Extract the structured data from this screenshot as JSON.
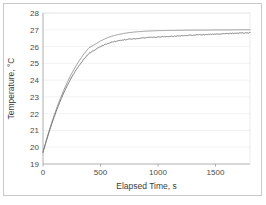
{
  "chart_data": {
    "type": "line",
    "title": "",
    "xlabel": "Elapsed Time, s",
    "ylabel": "Temperature, °C",
    "xlim": [
      0,
      1800
    ],
    "ylim": [
      19,
      28
    ],
    "xticks": [
      0,
      500,
      1000,
      1500
    ],
    "xtick_labels": [
      "0",
      "500",
      "1000",
      "1500"
    ],
    "yticks": [
      19,
      20,
      21,
      22,
      23,
      24,
      25,
      26,
      27,
      28
    ],
    "ytick_labels": [
      "19",
      "20",
      "21",
      "22",
      "23",
      "24",
      "25",
      "26",
      "27",
      "28"
    ],
    "grid": true,
    "grid_axis": "y",
    "legend": null,
    "legend_position": "none",
    "series": [
      {
        "name": "model",
        "style": "smooth-line",
        "color": "#8c8c8c",
        "x": [
          0,
          25,
          50,
          75,
          100,
          125,
          150,
          175,
          200,
          225,
          250,
          275,
          300,
          350,
          400,
          450,
          500,
          550,
          600,
          650,
          700,
          750,
          800,
          900,
          1000,
          1100,
          1200,
          1300,
          1400,
          1500,
          1600,
          1700,
          1800
        ],
        "y": [
          19.7,
          20.32,
          20.9,
          21.45,
          21.96,
          22.44,
          22.89,
          23.31,
          23.7,
          24.06,
          24.4,
          24.71,
          25.0,
          25.51,
          25.93,
          26.12,
          26.33,
          26.5,
          26.62,
          26.71,
          26.78,
          26.83,
          26.87,
          26.92,
          26.95,
          26.96,
          26.97,
          26.98,
          26.98,
          26.99,
          26.99,
          27.0,
          27.0
        ]
      },
      {
        "name": "measured",
        "style": "noisy-line",
        "color": "#6e6e6e",
        "x": [
          0,
          25,
          50,
          75,
          100,
          125,
          150,
          175,
          200,
          225,
          250,
          275,
          300,
          350,
          400,
          450,
          500,
          550,
          600,
          650,
          700,
          750,
          800,
          850,
          900,
          950,
          1000,
          1050,
          1100,
          1150,
          1200,
          1250,
          1300,
          1350,
          1400,
          1450,
          1500,
          1550,
          1600,
          1650,
          1700,
          1750,
          1800
        ],
        "y": [
          19.7,
          20.28,
          20.84,
          21.37,
          21.86,
          22.32,
          22.75,
          23.15,
          23.52,
          23.86,
          24.18,
          24.47,
          24.74,
          25.21,
          25.59,
          25.8,
          26.0,
          26.15,
          26.26,
          26.34,
          26.4,
          26.44,
          26.47,
          26.5,
          26.52,
          26.55,
          26.57,
          26.59,
          26.61,
          26.62,
          26.64,
          26.66,
          26.68,
          26.7,
          26.71,
          26.73,
          26.74,
          26.76,
          26.77,
          26.79,
          26.8,
          26.81,
          26.82
        ]
      }
    ]
  },
  "figure": {
    "background_color": "#ffffff",
    "border_color": "#c9c9c9",
    "axis_color": "#9a9a9a",
    "grid_color": "#ededed",
    "tick_text_color": "#4a4a4a",
    "axis_title_color": "#3c3c3c"
  }
}
